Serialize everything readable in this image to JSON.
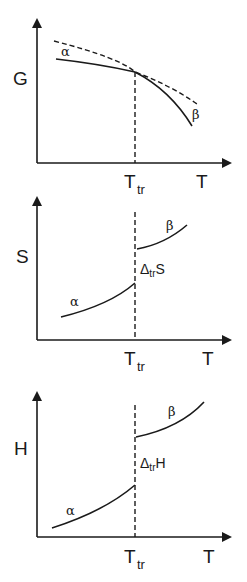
{
  "figure": {
    "panels": [
      {
        "id": "gibbs",
        "y_label": "G",
        "x_label": "T",
        "transition_label": "T",
        "transition_sub": "tr",
        "phase_low": "α",
        "phase_high": "β"
      },
      {
        "id": "entropy",
        "y_label": "S",
        "x_label": "T",
        "transition_label": "T",
        "transition_sub": "tr",
        "phase_low": "α",
        "phase_high": "β",
        "jump_delta": "Δ",
        "jump_sub": "tr",
        "jump_var": "S"
      },
      {
        "id": "enthalpy",
        "y_label": "H",
        "x_label": "T",
        "transition_label": "T",
        "transition_sub": "tr",
        "phase_low": "α",
        "phase_high": "β",
        "jump_delta": "Δ",
        "jump_sub": "tr",
        "jump_var": "H"
      }
    ],
    "colors": {
      "ink": "#1a1a1a",
      "background": "#ffffff"
    }
  }
}
